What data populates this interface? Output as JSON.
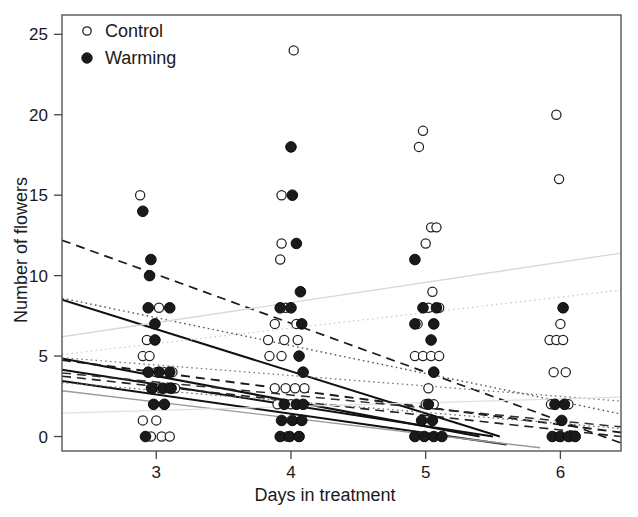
{
  "chart_data": {
    "type": "scatter",
    "title": "",
    "xlabel": "Days in treatment",
    "ylabel": "Number of flowers",
    "xlim": [
      2.3,
      6.45
    ],
    "ylim": [
      -0.9,
      26.2
    ],
    "xticks": [
      3,
      4,
      5,
      6
    ],
    "yticks": [
      0,
      5,
      10,
      15,
      20,
      25
    ],
    "xtick_labels": [
      "3",
      "4",
      "5",
      "6"
    ],
    "ytick_labels": [
      "0",
      "5",
      "10",
      "15",
      "20",
      "25"
    ],
    "grid": false,
    "legend_position": "top-left",
    "legend": [
      {
        "name": "Control",
        "marker": "open-circle",
        "color": "#ffffff",
        "edge": "#222222"
      },
      {
        "name": "Warming",
        "marker": "filled-circle",
        "color": "#1a1a1a",
        "edge": "#1a1a1a"
      }
    ],
    "series": [
      {
        "name": "Control",
        "marker": "open-circle",
        "points": [
          [
            2.88,
            15
          ],
          [
            3.02,
            8
          ],
          [
            2.93,
            6
          ],
          [
            2.9,
            5
          ],
          [
            2.95,
            5
          ],
          [
            3.0,
            4
          ],
          [
            3.06,
            4
          ],
          [
            3.12,
            4
          ],
          [
            2.96,
            3
          ],
          [
            3.03,
            3
          ],
          [
            3.09,
            3
          ],
          [
            3.14,
            3
          ],
          [
            3.06,
            2
          ],
          [
            2.9,
            1
          ],
          [
            3.0,
            1
          ],
          [
            2.96,
            0
          ],
          [
            3.04,
            0
          ],
          [
            3.1,
            0
          ],
          [
            4.02,
            24
          ],
          [
            3.93,
            15
          ],
          [
            3.93,
            12
          ],
          [
            3.92,
            11
          ],
          [
            3.96,
            8
          ],
          [
            4.04,
            7
          ],
          [
            3.88,
            7
          ],
          [
            3.83,
            6
          ],
          [
            3.95,
            6
          ],
          [
            4.05,
            6
          ],
          [
            3.84,
            5
          ],
          [
            3.93,
            5
          ],
          [
            3.88,
            3
          ],
          [
            3.96,
            3
          ],
          [
            4.03,
            3
          ],
          [
            4.1,
            3
          ],
          [
            3.9,
            2
          ],
          [
            4.0,
            2
          ],
          [
            3.97,
            0
          ],
          [
            4.06,
            0
          ],
          [
            4.98,
            19
          ],
          [
            4.95,
            18
          ],
          [
            5.04,
            13
          ],
          [
            5.08,
            13
          ],
          [
            5.0,
            12
          ],
          [
            5.05,
            9
          ],
          [
            5.02,
            8
          ],
          [
            5.1,
            8
          ],
          [
            4.94,
            7
          ],
          [
            5.06,
            7
          ],
          [
            4.92,
            5
          ],
          [
            4.98,
            5
          ],
          [
            5.04,
            5
          ],
          [
            5.1,
            5
          ],
          [
            5.02,
            3
          ],
          [
            5.0,
            2
          ],
          [
            5.06,
            2
          ],
          [
            5.97,
            20
          ],
          [
            5.99,
            16
          ],
          [
            6.02,
            8
          ],
          [
            6.0,
            7
          ],
          [
            5.92,
            6
          ],
          [
            5.97,
            6
          ],
          [
            6.02,
            6
          ],
          [
            5.95,
            4
          ],
          [
            6.04,
            4
          ],
          [
            5.93,
            2
          ],
          [
            6.06,
            2
          ],
          [
            5.99,
            0
          ],
          [
            6.07,
            0
          ]
        ]
      },
      {
        "name": "Warming",
        "marker": "filled-circle",
        "points": [
          [
            2.9,
            14
          ],
          [
            2.96,
            11
          ],
          [
            2.95,
            10
          ],
          [
            2.94,
            8
          ],
          [
            3.1,
            8
          ],
          [
            2.99,
            7
          ],
          [
            2.99,
            6
          ],
          [
            2.94,
            4
          ],
          [
            3.02,
            4
          ],
          [
            3.1,
            4
          ],
          [
            2.97,
            3
          ],
          [
            3.05,
            3
          ],
          [
            3.11,
            3
          ],
          [
            2.98,
            2
          ],
          [
            3.06,
            2
          ],
          [
            2.92,
            0
          ],
          [
            4.0,
            18
          ],
          [
            4.01,
            15
          ],
          [
            4.04,
            12
          ],
          [
            4.07,
            9
          ],
          [
            3.92,
            8
          ],
          [
            4.0,
            8
          ],
          [
            4.08,
            7
          ],
          [
            4.06,
            5
          ],
          [
            4.09,
            4
          ],
          [
            3.95,
            2
          ],
          [
            4.04,
            2
          ],
          [
            4.09,
            2
          ],
          [
            3.93,
            1
          ],
          [
            4.01,
            1
          ],
          [
            4.08,
            1
          ],
          [
            3.92,
            0
          ],
          [
            3.99,
            0
          ],
          [
            4.06,
            0
          ],
          [
            4.92,
            11
          ],
          [
            4.98,
            8
          ],
          [
            5.08,
            8
          ],
          [
            4.92,
            7
          ],
          [
            5.06,
            7
          ],
          [
            5.04,
            6
          ],
          [
            5.06,
            4
          ],
          [
            5.02,
            2
          ],
          [
            4.97,
            1
          ],
          [
            5.05,
            1
          ],
          [
            4.92,
            0
          ],
          [
            4.99,
            0
          ],
          [
            5.06,
            0
          ],
          [
            5.12,
            0
          ],
          [
            6.02,
            8
          ],
          [
            5.96,
            2
          ],
          [
            6.03,
            2
          ],
          [
            6.01,
            1
          ],
          [
            5.94,
            0
          ],
          [
            6.0,
            0
          ],
          [
            6.06,
            0
          ],
          [
            6.11,
            0
          ]
        ]
      }
    ],
    "trend_lines": [
      {
        "id": "line-1",
        "style": "dashed",
        "color": "#1a1a1a",
        "width": 1.7,
        "x0": 2.3,
        "y0": 12.2,
        "x1": 6.45,
        "y1": -0.4
      },
      {
        "id": "line-2",
        "style": "solid",
        "color": "#111111",
        "width": 2.1,
        "x0": 2.3,
        "y0": 8.5,
        "x1": 5.55,
        "y1": 0.0
      },
      {
        "id": "line-3",
        "style": "dotted",
        "color": "#555555",
        "width": 1.4,
        "x0": 2.3,
        "y0": 8.6,
        "x1": 6.45,
        "y1": 1.4
      },
      {
        "id": "line-4",
        "style": "solid",
        "color": "#d9d9d9",
        "width": 1.3,
        "x0": 2.3,
        "y0": 6.2,
        "x1": 6.45,
        "y1": 11.4
      },
      {
        "id": "line-5",
        "style": "dotted",
        "color": "#c9c9c9",
        "width": 1.2,
        "x0": 2.3,
        "y0": 5.1,
        "x1": 6.45,
        "y1": 9.1
      },
      {
        "id": "line-6",
        "style": "solid",
        "color": "#111111",
        "width": 2.2,
        "x0": 2.3,
        "y0": 4.85,
        "x1": 5.4,
        "y1": 0.0
      },
      {
        "id": "line-7",
        "style": "dashed",
        "color": "#1a1a1a",
        "width": 1.9,
        "x0": 2.3,
        "y0": 4.75,
        "x1": 6.45,
        "y1": 0.25
      },
      {
        "id": "line-8",
        "style": "dotted",
        "color": "#7a7a7a",
        "width": 1.3,
        "x0": 2.3,
        "y0": 4.9,
        "x1": 6.45,
        "y1": 2.2
      },
      {
        "id": "line-9",
        "style": "solid",
        "color": "#111111",
        "width": 1.9,
        "x0": 2.3,
        "y0": 4.15,
        "x1": 5.5,
        "y1": 0.0
      },
      {
        "id": "line-10",
        "style": "dashed",
        "color": "#222222",
        "width": 1.6,
        "x0": 2.3,
        "y0": 3.75,
        "x1": 6.45,
        "y1": 0.0
      },
      {
        "id": "line-11",
        "style": "solid",
        "color": "#111111",
        "width": 2.0,
        "x0": 2.3,
        "y0": 3.45,
        "x1": 5.6,
        "y1": -0.5
      },
      {
        "id": "line-12",
        "style": "dotted",
        "color": "#6f6f6f",
        "width": 1.3,
        "x0": 2.3,
        "y0": 3.35,
        "x1": 6.45,
        "y1": 0.5
      },
      {
        "id": "line-13",
        "style": "solid",
        "color": "#9a9a9a",
        "width": 1.4,
        "x0": 2.3,
        "y0": 2.85,
        "x1": 5.85,
        "y1": -0.7
      },
      {
        "id": "line-14",
        "style": "solid",
        "color": "#e0e0e0",
        "width": 1.2,
        "x0": 2.3,
        "y0": 1.45,
        "x1": 6.45,
        "y1": 2.45
      },
      {
        "id": "line-15",
        "style": "dashed",
        "color": "#303030",
        "width": 1.5,
        "x0": 2.3,
        "y0": 3.95,
        "x1": 6.45,
        "y1": 0.6
      }
    ]
  },
  "axes": {
    "y_title": "Number of flowers",
    "x_title": "Days in treatment"
  },
  "legend": {
    "control": "Control",
    "warming": "Warming"
  }
}
